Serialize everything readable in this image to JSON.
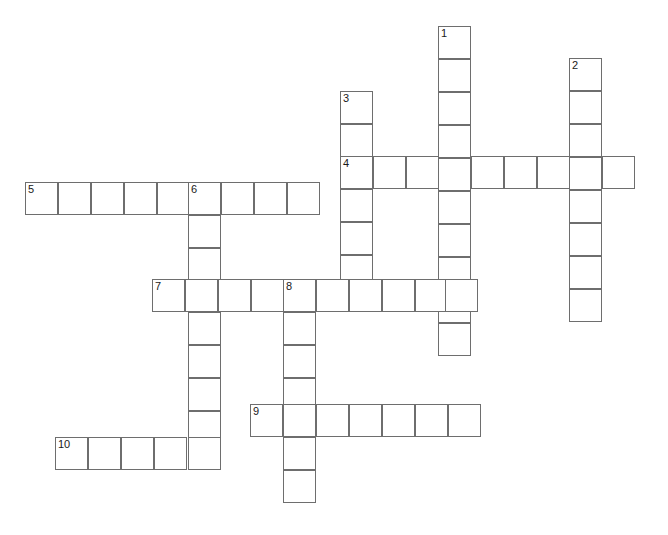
{
  "puzzle": {
    "title": "Crossword Puzzle Grid",
    "cell_size": 33,
    "grid_origin": {
      "x": 25,
      "y": 26
    },
    "background_color": "#ffffff",
    "cell_border_color": "#6e6e6e",
    "number_color": "#1a1a1a",
    "numbers_visible": [
      "1",
      "2",
      "3",
      "4",
      "5",
      "6",
      "7",
      "8",
      "9",
      "10"
    ],
    "entries": [
      {
        "number": "1",
        "direction": "down",
        "length": 9,
        "start": {
          "x": 438,
          "y": 26
        },
        "value": ""
      },
      {
        "number": "2",
        "direction": "down",
        "length": 8,
        "start": {
          "x": 569,
          "y": 58
        },
        "value": ""
      },
      {
        "number": "3",
        "direction": "down",
        "length": 7,
        "start": {
          "x": 340,
          "y": 91
        },
        "value": ""
      },
      {
        "number": "4",
        "direction": "across",
        "length": 9,
        "start": {
          "x": 340,
          "y": 156
        },
        "value": ""
      },
      {
        "number": "5",
        "direction": "across",
        "length": 9,
        "start": {
          "x": 25,
          "y": 182
        },
        "value": ""
      },
      {
        "number": "6",
        "direction": "down",
        "length": 9,
        "start": {
          "x": 188,
          "y": 182
        },
        "value": ""
      },
      {
        "number": "7",
        "direction": "across",
        "length": 10,
        "start": {
          "x": 152,
          "y": 279
        },
        "value": ""
      },
      {
        "number": "8",
        "direction": "down",
        "length": 7,
        "start": {
          "x": 283,
          "y": 279
        },
        "value": ""
      },
      {
        "number": "9",
        "direction": "across",
        "length": 7,
        "start": {
          "x": 250,
          "y": 404
        },
        "value": ""
      },
      {
        "number": "10",
        "direction": "across",
        "length": 5,
        "start": {
          "x": 55,
          "y": 437
        },
        "value": ""
      }
    ],
    "cells": [
      {
        "x": 438,
        "y": 26,
        "num": "1"
      },
      {
        "x": 438,
        "y": 59,
        "num": ""
      },
      {
        "x": 438,
        "y": 92,
        "num": ""
      },
      {
        "x": 438,
        "y": 125,
        "num": ""
      },
      {
        "x": 438,
        "y": 158,
        "num": ""
      },
      {
        "x": 438,
        "y": 191,
        "num": ""
      },
      {
        "x": 438,
        "y": 224,
        "num": ""
      },
      {
        "x": 438,
        "y": 257,
        "num": ""
      },
      {
        "x": 438,
        "y": 290,
        "num": ""
      },
      {
        "x": 438,
        "y": 323,
        "num": ""
      },
      {
        "x": 569,
        "y": 58,
        "num": "2"
      },
      {
        "x": 569,
        "y": 91,
        "num": ""
      },
      {
        "x": 569,
        "y": 124,
        "num": ""
      },
      {
        "x": 569,
        "y": 157,
        "num": ""
      },
      {
        "x": 569,
        "y": 190,
        "num": ""
      },
      {
        "x": 569,
        "y": 223,
        "num": ""
      },
      {
        "x": 569,
        "y": 256,
        "num": ""
      },
      {
        "x": 569,
        "y": 289,
        "num": ""
      },
      {
        "x": 340,
        "y": 91,
        "num": "3"
      },
      {
        "x": 340,
        "y": 124,
        "num": ""
      },
      {
        "x": 340,
        "y": 156,
        "num": "4"
      },
      {
        "x": 340,
        "y": 189,
        "num": ""
      },
      {
        "x": 340,
        "y": 222,
        "num": ""
      },
      {
        "x": 340,
        "y": 255,
        "num": ""
      },
      {
        "x": 340,
        "y": 279,
        "num": ""
      },
      {
        "x": 373,
        "y": 156,
        "num": ""
      },
      {
        "x": 406,
        "y": 156,
        "num": ""
      },
      {
        "x": 471,
        "y": 156,
        "num": ""
      },
      {
        "x": 504,
        "y": 156,
        "num": ""
      },
      {
        "x": 537,
        "y": 156,
        "num": ""
      },
      {
        "x": 602,
        "y": 156,
        "num": ""
      },
      {
        "x": 25,
        "y": 182,
        "num": "5"
      },
      {
        "x": 58,
        "y": 182,
        "num": ""
      },
      {
        "x": 91,
        "y": 182,
        "num": ""
      },
      {
        "x": 124,
        "y": 182,
        "num": ""
      },
      {
        "x": 157,
        "y": 182,
        "num": ""
      },
      {
        "x": 188,
        "y": 182,
        "num": "6"
      },
      {
        "x": 221,
        "y": 182,
        "num": ""
      },
      {
        "x": 254,
        "y": 182,
        "num": ""
      },
      {
        "x": 287,
        "y": 182,
        "num": ""
      },
      {
        "x": 188,
        "y": 215,
        "num": ""
      },
      {
        "x": 188,
        "y": 248,
        "num": ""
      },
      {
        "x": 188,
        "y": 312,
        "num": ""
      },
      {
        "x": 188,
        "y": 345,
        "num": ""
      },
      {
        "x": 188,
        "y": 378,
        "num": ""
      },
      {
        "x": 188,
        "y": 411,
        "num": ""
      },
      {
        "x": 188,
        "y": 437,
        "num": ""
      },
      {
        "x": 152,
        "y": 279,
        "num": "7"
      },
      {
        "x": 185,
        "y": 279,
        "num": ""
      },
      {
        "x": 218,
        "y": 279,
        "num": ""
      },
      {
        "x": 251,
        "y": 279,
        "num": ""
      },
      {
        "x": 283,
        "y": 279,
        "num": "8"
      },
      {
        "x": 316,
        "y": 279,
        "num": ""
      },
      {
        "x": 349,
        "y": 279,
        "num": ""
      },
      {
        "x": 382,
        "y": 279,
        "num": ""
      },
      {
        "x": 415,
        "y": 279,
        "num": ""
      },
      {
        "x": 445,
        "y": 279,
        "num": ""
      },
      {
        "x": 283,
        "y": 312,
        "num": ""
      },
      {
        "x": 283,
        "y": 345,
        "num": ""
      },
      {
        "x": 283,
        "y": 378,
        "num": ""
      },
      {
        "x": 283,
        "y": 404,
        "num": ""
      },
      {
        "x": 283,
        "y": 437,
        "num": ""
      },
      {
        "x": 283,
        "y": 470,
        "num": ""
      },
      {
        "x": 250,
        "y": 404,
        "num": "9"
      },
      {
        "x": 316,
        "y": 404,
        "num": ""
      },
      {
        "x": 349,
        "y": 404,
        "num": ""
      },
      {
        "x": 382,
        "y": 404,
        "num": ""
      },
      {
        "x": 415,
        "y": 404,
        "num": ""
      },
      {
        "x": 448,
        "y": 404,
        "num": ""
      },
      {
        "x": 55,
        "y": 437,
        "num": "10"
      },
      {
        "x": 88,
        "y": 437,
        "num": ""
      },
      {
        "x": 121,
        "y": 437,
        "num": ""
      },
      {
        "x": 154,
        "y": 437,
        "num": ""
      }
    ]
  }
}
